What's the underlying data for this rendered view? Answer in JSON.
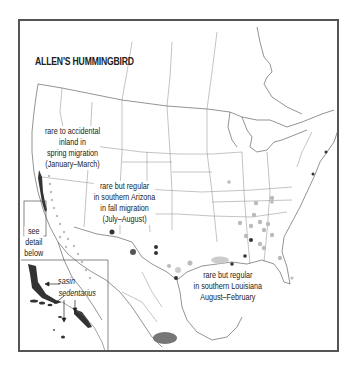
{
  "title": "ALLEN'S HUMMINGBIRD",
  "annotations": {
    "spring": {
      "lines": [
        "rare to accidental",
        "inland in",
        "spring migration",
        "(January–March)"
      ]
    },
    "arizona": {
      "lines": [
        "rare but regular",
        "in southern Arizona",
        "in fall migration",
        "(July–August)"
      ]
    },
    "louisiana": {
      "lines": [
        "rare but regular",
        "in southern Louisiana",
        "August–February"
      ]
    },
    "detail": {
      "lines": [
        "see",
        "detail",
        "below"
      ]
    },
    "subspecies": {
      "sasin": "sasin",
      "sedentarius": "sedentarius"
    }
  },
  "legend_colors": {
    "breeding_range": "#333333",
    "wintering_range": "#777777",
    "migration_dots": "#bbbbbb",
    "rare_record_dark": "#333333",
    "rare_record_light": "#bbbbbb",
    "map_outline": "#555555",
    "frame": "#555555"
  }
}
